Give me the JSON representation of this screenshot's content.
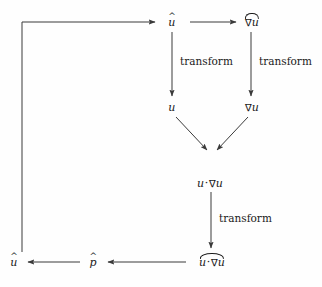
{
  "diagram": {
    "background_color": "#fefefe",
    "line_color": "#3a3a3a",
    "text_color": "#1a1a1a",
    "nodes": [
      {
        "id": "u_hat_top",
        "label": "u",
        "accent": "hat",
        "x": 172,
        "y": 22
      },
      {
        "id": "grad_u_hat",
        "label": "∇u",
        "accent": "widehat",
        "x": 252,
        "y": 22
      },
      {
        "id": "u_phys",
        "label": "u",
        "accent": "none",
        "x": 172,
        "y": 107
      },
      {
        "id": "grad_u_phys",
        "label": "∇u",
        "accent": "none",
        "x": 252,
        "y": 107
      },
      {
        "id": "u_dot_grad_u",
        "label": "u·∇u",
        "accent": "none",
        "x": 210,
        "y": 183
      },
      {
        "id": "u_dot_grad_u_hat",
        "label": "u·∇u",
        "accent": "widehat",
        "x": 212,
        "y": 262
      },
      {
        "id": "p_hat",
        "label": "p",
        "accent": "hat",
        "x": 93,
        "y": 262
      },
      {
        "id": "u_hat_out",
        "label": "u",
        "accent": "hat",
        "x": 14,
        "y": 262
      }
    ],
    "edge_labels": [
      {
        "id": "transform-left",
        "text": "transform",
        "x": 180,
        "y": 61
      },
      {
        "id": "transform-right",
        "text": "transform",
        "x": 259,
        "y": 61
      },
      {
        "id": "transform-bottom",
        "text": "transform",
        "x": 219,
        "y": 218
      }
    ],
    "edges": [
      {
        "id": "feedback-loop",
        "from": "u_hat_out",
        "to": "u_hat_top",
        "shape": "elbow"
      },
      {
        "id": "uhat-to-graduhat",
        "from": "u_hat_top",
        "to": "grad_u_hat",
        "shape": "horizontal"
      },
      {
        "id": "uhat-to-u",
        "from": "u_hat_top",
        "to": "u_phys",
        "shape": "vertical"
      },
      {
        "id": "graduhat-to-gradu",
        "from": "grad_u_hat",
        "to": "grad_u_phys",
        "shape": "vertical"
      },
      {
        "id": "u-to-product",
        "from": "u_phys",
        "to": "u_dot_grad_u",
        "shape": "diagonal"
      },
      {
        "id": "gradu-to-product",
        "from": "grad_u_phys",
        "to": "u_dot_grad_u",
        "shape": "diagonal"
      },
      {
        "id": "product-to-hat",
        "from": "u_dot_grad_u",
        "to": "u_dot_grad_u_hat",
        "shape": "vertical"
      },
      {
        "id": "hat-to-phat",
        "from": "u_dot_grad_u_hat",
        "to": "p_hat",
        "shape": "horizontal"
      },
      {
        "id": "phat-to-uhat",
        "from": "p_hat",
        "to": "u_hat_out",
        "shape": "horizontal"
      }
    ]
  }
}
